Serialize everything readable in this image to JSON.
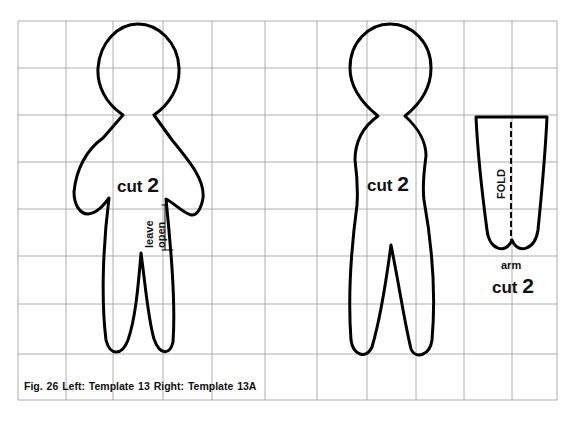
{
  "figure": {
    "caption": "Fig. 26  Left: Template 13  Right: Template 13A",
    "grid": {
      "x_lines": [
        18,
        66,
        113,
        163,
        212,
        265,
        317,
        367,
        416,
        464,
        512,
        557
      ],
      "y_lines": [
        21,
        68,
        115,
        162,
        209,
        256,
        304,
        354,
        400
      ],
      "color": "#9a9a9a"
    },
    "outline_color": "#000000"
  },
  "template_13": {
    "cut_label": "cut",
    "cut_count": "2",
    "leave_open_line1": "leave",
    "leave_open_line2": "open"
  },
  "template_13a": {
    "body": {
      "cut_label": "cut",
      "cut_count": "2"
    },
    "arm": {
      "fold_label": "FOLD",
      "name_label": "arm",
      "cut_label": "cut",
      "cut_count": "2"
    }
  }
}
